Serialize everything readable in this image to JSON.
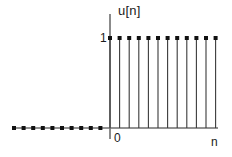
{
  "figure": {
    "title": "",
    "y_axis_label": "u[n]",
    "x_axis_label": "n",
    "origin_tick_label": "0",
    "amplitude_tick_label": "1",
    "colors": {
      "axis": "#6e6e6e",
      "stem": "#3a3a3a",
      "marker": "#111111",
      "text": "#1a1a1a",
      "background": "#ffffff"
    }
  },
  "chart_data": {
    "type": "scatter",
    "title": "",
    "xlabel": "n",
    "ylabel": "u[n]",
    "x": [
      -12,
      -11,
      -10,
      -9,
      -8,
      -7,
      -6,
      -5,
      -4,
      -3,
      -2,
      -1,
      0,
      1,
      2,
      3,
      4,
      5,
      6,
      7,
      8,
      9,
      10,
      11
    ],
    "values": [
      0,
      0,
      0,
      0,
      0,
      0,
      0,
      0,
      0,
      0,
      0,
      0,
      1,
      1,
      1,
      1,
      1,
      1,
      1,
      1,
      1,
      1,
      1,
      1
    ],
    "series": [
      {
        "name": "u[n]",
        "values": [
          0,
          0,
          0,
          0,
          0,
          0,
          0,
          0,
          0,
          0,
          0,
          0,
          1,
          1,
          1,
          1,
          1,
          1,
          1,
          1,
          1,
          1,
          1,
          1
        ]
      }
    ],
    "xlim": [
      -13.5,
      12.5
    ],
    "ylim": [
      0,
      1.18
    ],
    "xticks": [
      0
    ],
    "xticklabels": [
      "0"
    ],
    "yticks": [
      1
    ],
    "yticklabels": [
      "1"
    ],
    "grid": false,
    "legend": null,
    "marker": "dot",
    "stem": true
  }
}
